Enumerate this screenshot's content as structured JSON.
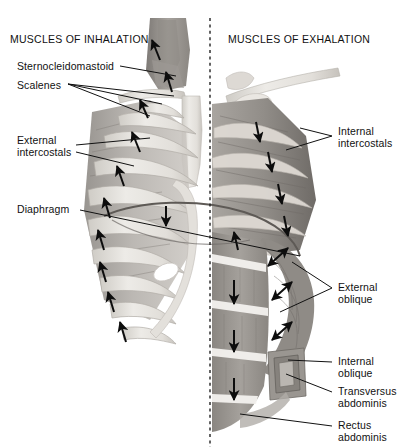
{
  "figure": {
    "title_left": "MUSCLES OF INHALATION",
    "title_right": "MUSCLES OF EXHALATION",
    "background": "#ffffff",
    "text_color": "#111111",
    "midline": {
      "name": "vertical-dashed-midline",
      "x": 210,
      "y_top": 18,
      "y_bottom": 447,
      "style": "dashed"
    }
  },
  "labels_left": [
    {
      "id": "sternocleidomastoid",
      "text": "Sternocleidomastoid",
      "x": 17,
      "y": 61,
      "leaders": 1
    },
    {
      "id": "scalenes",
      "text": "Scalenes",
      "x": 17,
      "y": 80,
      "leaders": 3
    },
    {
      "id": "external-intercostals",
      "line1": "External",
      "line2": "intercostals",
      "x": 17,
      "y": 141,
      "leaders": 2
    },
    {
      "id": "diaphragm",
      "text": "Diaphragm",
      "x": 17,
      "y": 205,
      "leaders": 1
    }
  ],
  "labels_right": [
    {
      "id": "internal-intercostals",
      "line1": "Internal",
      "line2": "intercostals",
      "x": 338,
      "y": 132,
      "leaders": 2
    },
    {
      "id": "external-oblique",
      "line1": "External",
      "line2": "oblique",
      "x": 338,
      "y": 283,
      "leaders": 2
    },
    {
      "id": "internal-oblique",
      "line1": "Internal",
      "line2": "oblique",
      "x": 338,
      "y": 359,
      "leaders": 1
    },
    {
      "id": "transversus-abdominis",
      "line1": "Transversus",
      "line2": "abdominis",
      "x": 338,
      "y": 389,
      "leaders": 1
    },
    {
      "id": "rectus-abdominis",
      "line1": "Rectus",
      "line2": "abdominis",
      "x": 338,
      "y": 423,
      "leaders": 1
    }
  ],
  "colors": {
    "bone": "#e8e6e2",
    "bone_shade": "#cfccc6",
    "muscle_light": "#b9b5b0",
    "muscle_mid": "#98948f",
    "muscle_dark": "#7a7672",
    "arrow": "#0d0d0d",
    "leader": "#111111"
  },
  "arrows": {
    "inhalation_direction": "up",
    "exhalation_direction": "down",
    "oblique_direction": "diagonal-double-headed",
    "diaphragm_direction": "down",
    "left_rib_arrow_count": 7,
    "right_rib_arrow_count": 5,
    "rectus_arrow_count": 3,
    "oblique_arrow_count": 3
  }
}
